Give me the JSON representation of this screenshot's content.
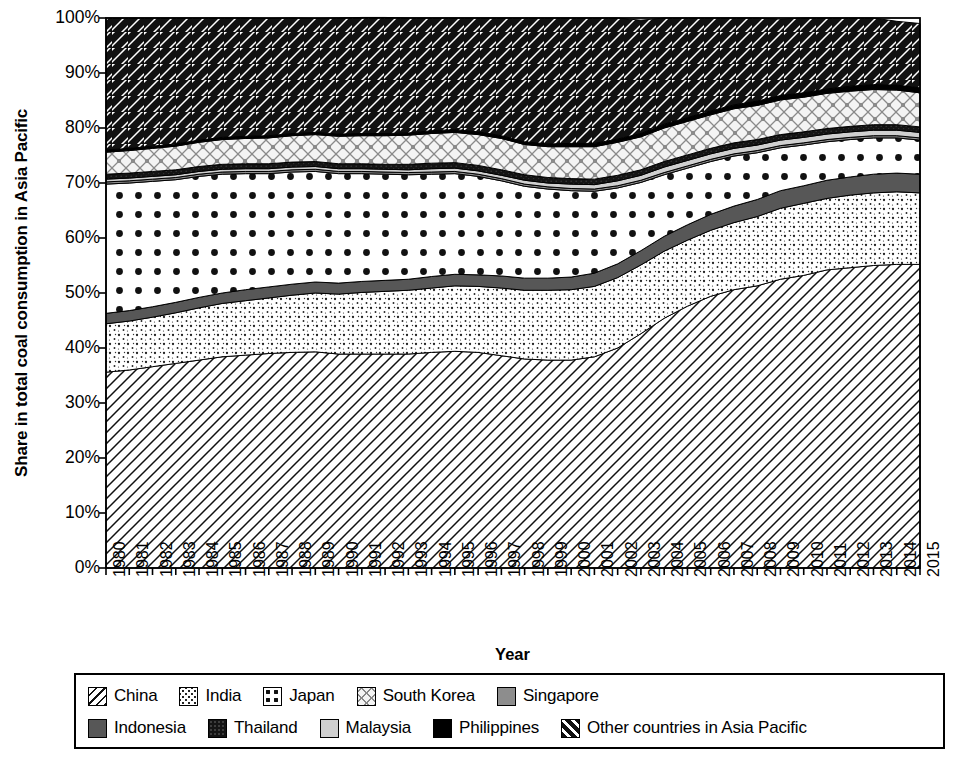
{
  "chart_data": {
    "type": "area",
    "stacked": true,
    "title": "",
    "xlabel": "Year",
    "ylabel": "Share in total coal consumption in Asia Pacific",
    "ylim": [
      0,
      100
    ],
    "y_tick_labels": [
      "0%",
      "10%",
      "20%",
      "30%",
      "40%",
      "50%",
      "60%",
      "70%",
      "80%",
      "90%",
      "100%"
    ],
    "y_ticks": [
      0,
      10,
      20,
      30,
      40,
      50,
      60,
      70,
      80,
      90,
      100
    ],
    "grid": false,
    "legend_position": "bottom",
    "categories": [
      "1980",
      "1981",
      "1982",
      "1983",
      "1984",
      "1985",
      "1986",
      "1987",
      "1988",
      "1989",
      "1990",
      "1991",
      "1992",
      "1993",
      "1994",
      "1995",
      "1996",
      "1997",
      "1998",
      "1999",
      "2000",
      "2001",
      "2002",
      "2003",
      "2004",
      "2005",
      "2006",
      "2007",
      "2008",
      "2009",
      "2010",
      "2011",
      "2012",
      "2013",
      "2014",
      "2015"
    ],
    "series": [
      {
        "name": "China",
        "pattern": "diagonal-hatch-backslash",
        "values": [
          35.6,
          36.0,
          36.6,
          37.2,
          37.8,
          38.4,
          38.7,
          39.0,
          39.2,
          39.3,
          38.9,
          38.9,
          38.9,
          38.9,
          39.2,
          39.4,
          39.2,
          38.6,
          38.0,
          37.8,
          37.8,
          38.4,
          40.0,
          42.6,
          45.4,
          47.6,
          49.4,
          50.6,
          51.3,
          52.5,
          53.2,
          54.2,
          54.6,
          55.0,
          55.2,
          55.2
        ]
      },
      {
        "name": "India",
        "pattern": "fine-dots-sparse",
        "values": [
          8.8,
          8.9,
          9.0,
          9.2,
          9.5,
          9.7,
          9.9,
          10.1,
          10.4,
          10.7,
          10.9,
          11.2,
          11.4,
          11.6,
          11.7,
          11.9,
          12.0,
          12.3,
          12.5,
          12.7,
          12.8,
          12.8,
          12.8,
          12.5,
          12.2,
          12.0,
          12.0,
          12.2,
          12.6,
          12.9,
          13.1,
          13.0,
          13.2,
          13.2,
          13.2,
          13.0
        ]
      },
      {
        "name": "Indonesia",
        "pattern": "solid-dark-gray",
        "values": [
          1.9,
          1.9,
          1.9,
          1.9,
          1.9,
          1.9,
          2.0,
          2.0,
          2.0,
          2.0,
          2.0,
          2.0,
          2.0,
          2.0,
          2.1,
          2.1,
          2.1,
          2.2,
          2.2,
          2.2,
          2.3,
          2.4,
          2.5,
          2.6,
          2.7,
          2.8,
          2.9,
          3.0,
          3.1,
          3.2,
          3.2,
          3.3,
          3.3,
          3.4,
          3.4,
          3.4
        ]
      },
      {
        "name": "Japan",
        "pattern": "large-dots",
        "values": [
          23.5,
          23.2,
          22.8,
          22.3,
          22.0,
          21.6,
          21.1,
          20.6,
          20.4,
          20.1,
          19.9,
          19.6,
          19.3,
          19.0,
          18.6,
          18.3,
          17.9,
          17.3,
          16.7,
          16.2,
          15.7,
          14.9,
          13.8,
          12.4,
          11.2,
          10.3,
          9.6,
          9.1,
          8.5,
          7.8,
          7.4,
          7.0,
          6.8,
          6.6,
          6.4,
          6.2
        ]
      },
      {
        "name": "Singapore",
        "pattern": "medium-gray",
        "values": [
          0.4,
          0.4,
          0.4,
          0.4,
          0.4,
          0.4,
          0.4,
          0.4,
          0.4,
          0.4,
          0.4,
          0.4,
          0.4,
          0.4,
          0.4,
          0.4,
          0.4,
          0.4,
          0.4,
          0.4,
          0.4,
          0.4,
          0.4,
          0.4,
          0.4,
          0.4,
          0.4,
          0.4,
          0.4,
          0.4,
          0.4,
          0.4,
          0.4,
          0.4,
          0.4,
          0.4
        ]
      },
      {
        "name": "Malaysia",
        "pattern": "light-gray",
        "values": [
          0.5,
          0.5,
          0.5,
          0.5,
          0.5,
          0.5,
          0.5,
          0.5,
          0.5,
          0.5,
          0.5,
          0.5,
          0.5,
          0.5,
          0.6,
          0.6,
          0.6,
          0.6,
          0.7,
          0.7,
          0.8,
          0.8,
          0.9,
          0.9,
          1.0,
          1.0,
          1.0,
          1.0,
          1.0,
          1.0,
          1.0,
          1.0,
          1.0,
          1.0,
          1.0,
          1.0
        ]
      },
      {
        "name": "Thailand",
        "pattern": "very-dark-texture",
        "values": [
          0.9,
          0.9,
          0.9,
          0.9,
          0.9,
          0.9,
          0.9,
          0.9,
          0.9,
          0.9,
          0.9,
          0.9,
          0.9,
          1.0,
          1.0,
          1.0,
          1.0,
          1.0,
          1.0,
          1.0,
          1.0,
          1.0,
          1.0,
          1.0,
          1.0,
          1.0,
          1.0,
          1.0,
          1.0,
          1.0,
          1.0,
          1.0,
          1.0,
          1.0,
          1.0,
          1.0
        ]
      },
      {
        "name": "South Korea",
        "pattern": "diamond-crosshatch",
        "values": [
          4.0,
          4.1,
          4.2,
          4.3,
          4.4,
          4.5,
          4.6,
          4.7,
          4.8,
          4.9,
          5.0,
          5.1,
          5.2,
          5.3,
          5.4,
          5.5,
          5.6,
          5.7,
          5.5,
          5.6,
          5.8,
          5.9,
          6.0,
          6.0,
          6.1,
          6.1,
          6.1,
          6.2,
          6.2,
          6.3,
          6.3,
          6.4,
          6.4,
          6.4,
          6.3,
          6.2
        ]
      },
      {
        "name": "Philippines",
        "pattern": "solid-black",
        "values": [
          0.4,
          0.4,
          0.4,
          0.4,
          0.4,
          0.4,
          0.4,
          0.4,
          0.4,
          0.4,
          0.4,
          0.4,
          0.4,
          0.4,
          0.5,
          0.5,
          0.5,
          0.5,
          0.5,
          0.5,
          0.6,
          0.6,
          0.6,
          0.6,
          0.7,
          0.7,
          0.7,
          0.7,
          0.8,
          0.8,
          0.8,
          0.8,
          0.9,
          0.9,
          0.9,
          0.9
        ]
      },
      {
        "name": "Other countries in Asia Pacific",
        "pattern": "bold-diagonal-hatch-forwardslash",
        "values": [
          24.0,
          23.7,
          23.3,
          22.9,
          22.2,
          21.7,
          21.5,
          21.3,
          21.0,
          20.7,
          21.1,
          21.1,
          21.1,
          20.9,
          20.5,
          20.3,
          20.7,
          21.4,
          22.5,
          22.9,
          22.8,
          22.8,
          22.0,
          20.6,
          19.3,
          18.1,
          16.9,
          15.8,
          15.1,
          13.9,
          13.6,
          12.9,
          12.4,
          12.1,
          11.6,
          11.7
        ]
      }
    ]
  },
  "axis": {
    "y_title": "Share in total coal consumption in Asia Pacific",
    "x_title": "Year"
  },
  "legend": {
    "row1": [
      {
        "label": "China",
        "pattern": "diagonal-hatch-backslash"
      },
      {
        "label": "India",
        "pattern": "fine-dots-sparse"
      },
      {
        "label": "Japan",
        "pattern": "large-dots"
      },
      {
        "label": "South Korea",
        "pattern": "diamond-crosshatch"
      },
      {
        "label": "Singapore",
        "pattern": "medium-gray"
      }
    ],
    "row2": [
      {
        "label": "Indonesia",
        "pattern": "solid-dark-gray"
      },
      {
        "label": "Thailand",
        "pattern": "very-dark-texture"
      },
      {
        "label": "Malaysia",
        "pattern": "light-gray"
      },
      {
        "label": "Philippines",
        "pattern": "solid-black"
      },
      {
        "label": "Other countries in Asia Pacific",
        "pattern": "bold-diagonal-hatch-forwardslash"
      }
    ]
  },
  "colors": {
    "china": "#ffffff",
    "india": "#ffffff",
    "indonesia": "#555555",
    "japan": "#ffffff",
    "singapore": "#8a8a8a",
    "malaysia": "#cfcfcf",
    "thailand": "#1c1c1c",
    "south_korea": "#f2f2f2",
    "philippines": "#000000",
    "other": "#ffffff",
    "axis": "#000000",
    "background": "#ffffff"
  }
}
